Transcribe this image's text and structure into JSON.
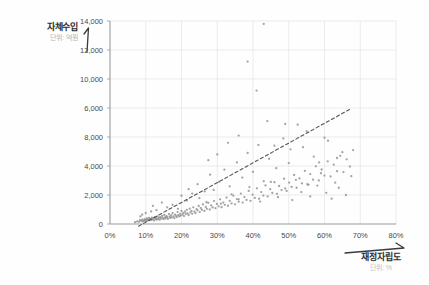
{
  "chart_data": {
    "type": "scatter",
    "title": "",
    "xlabel": "재정자립도",
    "xlabel_unit": "단위: %",
    "ylabel": "자체수입",
    "ylabel_unit": "단위: 억원",
    "xlim": [
      0,
      80
    ],
    "ylim": [
      0,
      14000
    ],
    "grid": true,
    "legend": "none",
    "x_tick_labels": [
      "0%",
      "10%",
      "20%",
      "30%",
      "40%",
      "50%",
      "60%",
      "70%",
      "80%"
    ],
    "x_tick_values": [
      0,
      10,
      20,
      30,
      40,
      50,
      60,
      70,
      80
    ],
    "y_tick_labels": [
      "14,000",
      "12,000",
      "10,000",
      "6,000",
      "8,000",
      "4,000",
      "2,000",
      "0"
    ],
    "y_tick_values": [
      14000,
      12000,
      10000,
      8000,
      6000,
      4000,
      2000,
      0
    ],
    "series": [
      {
        "name": "지방자치단체",
        "marker": "dot",
        "color": "#8a8a8a",
        "points": [
          [
            7.0,
            120
          ],
          [
            7.6,
            180
          ],
          [
            8.1,
            150
          ],
          [
            8.4,
            260
          ],
          [
            8.8,
            210
          ],
          [
            9.0,
            300
          ],
          [
            9.2,
            170
          ],
          [
            9.5,
            240
          ],
          [
            9.7,
            330
          ],
          [
            9.9,
            200
          ],
          [
            10.1,
            280
          ],
          [
            10.3,
            390
          ],
          [
            10.5,
            230
          ],
          [
            10.7,
            310
          ],
          [
            10.9,
            420
          ],
          [
            11.1,
            260
          ],
          [
            11.3,
            350
          ],
          [
            11.5,
            290
          ],
          [
            11.7,
            440
          ],
          [
            11.9,
            320
          ],
          [
            12.1,
            380
          ],
          [
            12.3,
            250
          ],
          [
            12.5,
            470
          ],
          [
            12.7,
            340
          ],
          [
            12.9,
            410
          ],
          [
            13.1,
            300
          ],
          [
            13.3,
            520
          ],
          [
            13.5,
            360
          ],
          [
            13.7,
            430
          ],
          [
            13.9,
            290
          ],
          [
            14.1,
            480
          ],
          [
            14.3,
            380
          ],
          [
            14.6,
            560
          ],
          [
            14.8,
            410
          ],
          [
            15.0,
            330
          ],
          [
            15.2,
            620
          ],
          [
            15.4,
            450
          ],
          [
            15.6,
            390
          ],
          [
            15.8,
            540
          ],
          [
            16.0,
            470
          ],
          [
            16.2,
            350
          ],
          [
            16.5,
            680
          ],
          [
            16.7,
            500
          ],
          [
            16.9,
            420
          ],
          [
            17.1,
            590
          ],
          [
            17.3,
            460
          ],
          [
            17.5,
            740
          ],
          [
            17.8,
            530
          ],
          [
            18.0,
            400
          ],
          [
            18.2,
            650
          ],
          [
            18.5,
            560
          ],
          [
            18.7,
            480
          ],
          [
            18.9,
            820
          ],
          [
            19.1,
            610
          ],
          [
            19.4,
            520
          ],
          [
            19.6,
            700
          ],
          [
            19.8,
            580
          ],
          [
            20.0,
            900
          ],
          [
            20.3,
            640
          ],
          [
            20.5,
            760
          ],
          [
            20.7,
            550
          ],
          [
            21.0,
            850
          ],
          [
            21.2,
            690
          ],
          [
            21.5,
            980
          ],
          [
            21.7,
            730
          ],
          [
            22.0,
            620
          ],
          [
            22.3,
            1060
          ],
          [
            22.5,
            800
          ],
          [
            22.8,
            900
          ],
          [
            23.0,
            700
          ],
          [
            23.3,
            1150
          ],
          [
            23.6,
            860
          ],
          [
            23.9,
            760
          ],
          [
            24.2,
            1020
          ],
          [
            24.5,
            940
          ],
          [
            24.8,
            1240
          ],
          [
            25.1,
            820
          ],
          [
            25.4,
            1100
          ],
          [
            25.7,
            980
          ],
          [
            26.0,
            1350
          ],
          [
            26.4,
            900
          ],
          [
            26.8,
            1180
          ],
          [
            27.1,
            1050
          ],
          [
            27.5,
            1460
          ],
          [
            27.9,
            1000
          ],
          [
            28.3,
            1280
          ],
          [
            28.7,
            1140
          ],
          [
            29.1,
            1580
          ],
          [
            29.5,
            1090
          ],
          [
            29.9,
            1380
          ],
          [
            30.4,
            1220
          ],
          [
            30.8,
            1700
          ],
          [
            31.2,
            1160
          ],
          [
            31.7,
            1480
          ],
          [
            32.1,
            1320
          ],
          [
            32.6,
            1820
          ],
          [
            33.0,
            1260
          ],
          [
            33.5,
            1600
          ],
          [
            34.0,
            1420
          ],
          [
            34.5,
            1950
          ],
          [
            35.0,
            1360
          ],
          [
            35.5,
            1720
          ],
          [
            36.0,
            1540
          ],
          [
            36.6,
            2100
          ],
          [
            37.1,
            1480
          ],
          [
            37.6,
            1860
          ],
          [
            38.2,
            1660
          ],
          [
            38.8,
            2280
          ],
          [
            39.3,
            1600
          ],
          [
            39.9,
            2020
          ],
          [
            40.5,
            1800
          ],
          [
            41.1,
            2460
          ],
          [
            41.7,
            1740
          ],
          [
            42.3,
            2200
          ],
          [
            42.9,
            1960
          ],
          [
            43.5,
            2660
          ],
          [
            44.1,
            1900
          ],
          [
            44.8,
            2400
          ],
          [
            45.4,
            2140
          ],
          [
            46.0,
            2880
          ],
          [
            46.7,
            2080
          ],
          [
            47.3,
            2620
          ],
          [
            48.0,
            2340
          ],
          [
            48.7,
            3120
          ],
          [
            49.4,
            2280
          ],
          [
            50.1,
            2860
          ],
          [
            50.8,
            2560
          ],
          [
            51.5,
            3380
          ],
          [
            52.2,
            2500
          ],
          [
            53.0,
            3140
          ],
          [
            53.7,
            2800
          ],
          [
            54.5,
            3660
          ],
          [
            55.2,
            2740
          ],
          [
            56.0,
            3440
          ],
          [
            56.8,
            3060
          ],
          [
            57.6,
            3980
          ],
          [
            58.4,
            3000
          ],
          [
            59.2,
            3760
          ],
          [
            60.0,
            3340
          ],
          [
            60.9,
            4320
          ],
          [
            61.7,
            3280
          ],
          [
            62.6,
            4100
          ],
          [
            63.5,
            3640
          ],
          [
            64.4,
            4700
          ],
          [
            65.3,
            3580
          ],
          [
            66.2,
            4460
          ],
          [
            67.1,
            3960
          ],
          [
            68.0,
            5100
          ],
          [
            22.0,
            2400
          ],
          [
            24.5,
            2750
          ],
          [
            26.5,
            2250
          ],
          [
            28.0,
            3400
          ],
          [
            30.5,
            2900
          ],
          [
            32.0,
            3750
          ],
          [
            33.5,
            2600
          ],
          [
            35.5,
            4250
          ],
          [
            37.0,
            3200
          ],
          [
            38.5,
            4900
          ],
          [
            40.0,
            3600
          ],
          [
            41.5,
            5450
          ],
          [
            43.0,
            2950
          ],
          [
            44.5,
            4500
          ],
          [
            46.5,
            3850
          ],
          [
            48.5,
            5900
          ],
          [
            50.0,
            4200
          ],
          [
            52.0,
            3050
          ],
          [
            54.0,
            5300
          ],
          [
            55.5,
            2700
          ],
          [
            57.0,
            4650
          ],
          [
            59.0,
            3500
          ],
          [
            61.0,
            5750
          ],
          [
            63.0,
            2850
          ],
          [
            65.0,
            4950
          ],
          [
            67.5,
            3300
          ],
          [
            20.0,
            1950
          ],
          [
            21.5,
            1620
          ],
          [
            23.0,
            2100
          ],
          [
            25.0,
            1780
          ],
          [
            27.0,
            1500
          ],
          [
            29.0,
            2350
          ],
          [
            31.0,
            1400
          ],
          [
            34.0,
            2050
          ],
          [
            36.0,
            1700
          ],
          [
            39.0,
            2550
          ],
          [
            42.0,
            1550
          ],
          [
            45.0,
            2900
          ],
          [
            47.0,
            1850
          ],
          [
            49.0,
            2450
          ],
          [
            51.0,
            1650
          ],
          [
            53.5,
            2200
          ],
          [
            56.0,
            1900
          ],
          [
            58.0,
            2650
          ],
          [
            60.5,
            2150
          ],
          [
            62.0,
            1750
          ],
          [
            64.0,
            2500
          ],
          [
            66.0,
            2000
          ],
          [
            16.0,
            1150
          ],
          [
            17.5,
            1320
          ],
          [
            19.0,
            1050
          ],
          [
            13.0,
            950
          ],
          [
            11.5,
            870
          ],
          [
            10.0,
            760
          ],
          [
            12.0,
            1250
          ],
          [
            14.5,
            1480
          ],
          [
            9.0,
            640
          ],
          [
            8.5,
            520
          ],
          [
            41.0,
            9200
          ],
          [
            44.0,
            7100
          ],
          [
            49.0,
            6900
          ],
          [
            52.5,
            6850
          ],
          [
            38.5,
            11200
          ],
          [
            60.0,
            5950
          ],
          [
            33.0,
            5600
          ],
          [
            46.0,
            5400
          ],
          [
            55.0,
            6400
          ],
          [
            30.0,
            4800
          ],
          [
            63.5,
            4550
          ],
          [
            36.0,
            6100
          ],
          [
            43.0,
            13800
          ],
          [
            27.5,
            4400
          ],
          [
            58.5,
            4250
          ],
          [
            50.5,
            5150
          ]
        ]
      }
    ],
    "trendline": {
      "style": "dashed",
      "color": "#555555",
      "x_start": 8.0,
      "y_start": -150,
      "x_end": 67.0,
      "y_end": 7900
    }
  },
  "axes": {
    "y_title": "자체수입",
    "y_unit": "단위: 억원",
    "x_title": "재정자립도",
    "x_unit": "단위: %"
  }
}
